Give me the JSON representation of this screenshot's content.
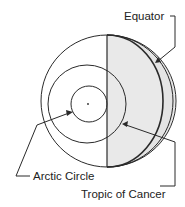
{
  "diagram": {
    "labels": {
      "equator": "Equator",
      "arctic_circle": "Arctic Circle",
      "tropic_of_cancer": "Tropic of Cancer"
    },
    "colors": {
      "line": "#2a2a2a",
      "shade": "#e4e4e4",
      "background": "#ffffff"
    }
  }
}
